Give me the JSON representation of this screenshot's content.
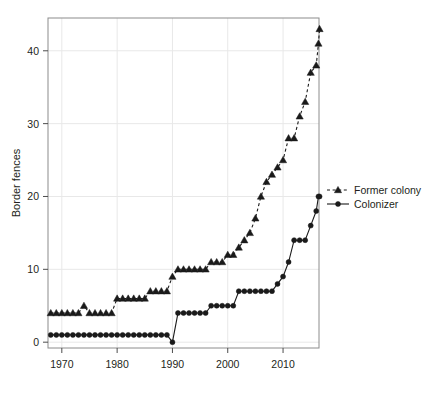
{
  "chart_data": {
    "type": "line",
    "title": "",
    "subtitle": "",
    "xlabel": "",
    "ylabel": "Border fences",
    "xlim": [
      1967.5,
      2016.5
    ],
    "ylim": [
      -0.8,
      44.5
    ],
    "xticks": [
      1970,
      1980,
      1990,
      2000,
      2010
    ],
    "yticks": [
      0,
      10,
      20,
      30,
      40
    ],
    "grid": true,
    "grid_color": "#e8e8e8",
    "legend_position": "right",
    "x": [
      1968,
      1969,
      1970,
      1971,
      1972,
      1973,
      1974,
      1975,
      1976,
      1977,
      1978,
      1979,
      1980,
      1981,
      1982,
      1983,
      1984,
      1985,
      1986,
      1987,
      1988,
      1989,
      1990,
      1991,
      1992,
      1993,
      1994,
      1995,
      1996,
      1997,
      1998,
      1999,
      2000,
      2001,
      2002,
      2003,
      2004,
      2005,
      2006,
      2007,
      2008,
      2009,
      2010,
      2011,
      2012,
      2013,
      2014,
      2015,
      2016
    ],
    "series": [
      {
        "name": "Former colony",
        "marker": "triangle",
        "linestyle": "dashed",
        "color": "#1a1a1a",
        "values": [
          4,
          4,
          4,
          4,
          4,
          4,
          5,
          4,
          4,
          4,
          4,
          4,
          6,
          6,
          6,
          6,
          6,
          6,
          7,
          7,
          7,
          7,
          9,
          10,
          10,
          10,
          10,
          10,
          10,
          11,
          11,
          11,
          12,
          12,
          13,
          14,
          15,
          17,
          20,
          22,
          23,
          24,
          25,
          28,
          28,
          31,
          33,
          37,
          38
        ]
      },
      {
        "name": "Colonizer",
        "marker": "circle",
        "linestyle": "solid",
        "color": "#1a1a1a",
        "values": [
          1,
          1,
          1,
          1,
          1,
          1,
          1,
          1,
          1,
          1,
          1,
          1,
          1,
          1,
          1,
          1,
          1,
          1,
          1,
          1,
          1,
          1,
          0,
          4,
          4,
          4,
          4,
          4,
          4,
          5,
          5,
          5,
          5,
          5,
          7,
          7,
          7,
          7,
          7,
          7,
          7,
          8,
          9,
          11,
          14,
          14,
          14,
          16,
          18
        ]
      }
    ],
    "series_extra_points": {
      "Former colony": [
        {
          "x": 2016.4,
          "y": 41
        },
        {
          "x": 2016.6,
          "y": 43
        }
      ],
      "Colonizer": [
        {
          "x": 2016.4,
          "y": 20
        },
        {
          "x": 2016.6,
          "y": 20
        }
      ]
    }
  },
  "legend": {
    "items": [
      {
        "label": "Former colony",
        "marker": "triangle",
        "linestyle": "dashed"
      },
      {
        "label": "Colonizer",
        "marker": "circle",
        "linestyle": "solid"
      }
    ]
  },
  "axis": {
    "ylabel": "Border fences",
    "ytick_labels": [
      "0",
      "10",
      "20",
      "30",
      "40"
    ],
    "xtick_labels": [
      "1970",
      "1980",
      "1990",
      "2000",
      "2010"
    ]
  },
  "colors": {
    "ink": "#1a1a1a",
    "grid": "#e8e8e8",
    "frame": "#808080",
    "background": "#ffffff"
  }
}
